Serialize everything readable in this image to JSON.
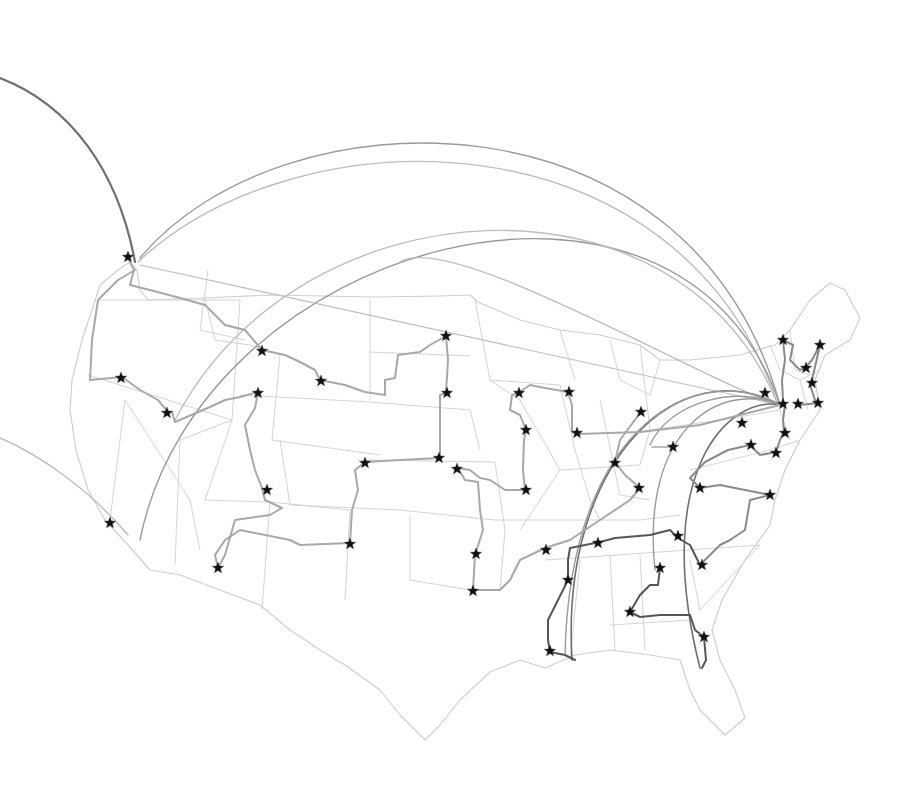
{
  "map": {
    "width": 898,
    "height": 802,
    "background": "#ffffff",
    "colors": {
      "state_border": "#d4d4d4",
      "route_light": "#a8a8a8",
      "route_mid": "#8a8a8a",
      "route_dark": "#555555",
      "arc_light": "#bdbdbd",
      "arc_mid": "#9a9a9a",
      "arc_dark": "#6f6f6f",
      "star": "#111111"
    },
    "outline": "M130,262 L137,270 L140,290 L148,300 L205,298 L270,295 L375,297 L440,296 L470,295 L478,302 L520,320 L560,330 L600,335 L640,345 L660,360 L690,360 L740,355 L775,345 L790,330 L810,300 L830,283 L845,290 L860,318 L850,340 L825,355 L815,380 L820,410 L800,440 L785,470 L775,500 L770,525 L745,560 L722,600 L712,630 L720,660 L735,690 L745,718 L725,735 L700,710 L690,690 L680,660 L650,655 L610,650 L575,655 L545,668 L520,660 L490,672 L460,700 L440,725 L425,740 L400,715 L380,690 L345,665 L320,650 L290,630 L260,605 L220,590 L180,575 L150,570 L128,545 L105,520 L88,490 L76,450 L70,410 L72,380 L82,340 L92,310 L100,285 L118,270 Z",
    "state_lines": [
      "M100,300 L240,300 M240,300 L232,420",
      "M88,375 L232,420",
      "M125,400 L110,520 M125,400 L190,500 L200,550",
      "M232,420 L180,440 L175,565",
      "M208,270 L200,330 L245,340",
      "M205,298 L215,340 L250,345 L280,355",
      "M280,355 L272,440 M272,440 L380,455",
      "M240,395 L370,402",
      "M232,420 L205,500 L270,502",
      "M270,502 L262,610",
      "M270,502 L350,510 L345,600",
      "M280,440 L290,505 L400,510",
      "M370,300 L370,400 M370,352 L470,356",
      "M370,402 L470,410 L480,450",
      "M365,460 L495,462",
      "M400,510 L495,520",
      "M410,515 L410,580 L470,590 L500,590",
      "M495,462 L505,530 L500,590",
      "M475,300 L490,380 L520,400",
      "M490,380 L560,385 M520,400 L560,470 L520,530",
      "M560,385 L575,450 L590,500 L600,520",
      "M600,400 L620,495 L650,500",
      "M495,520 L640,520 L680,515",
      "M545,560 L760,545",
      "M560,470 L640,465 L650,430 L720,420",
      "M640,345 L650,430",
      "M580,560 L570,660 M640,555 L645,650",
      "M610,555 L615,650 M610,625 L690,620",
      "M690,560 L700,610 L760,545",
      "M720,420 L780,410 L790,440",
      "M690,470 L770,450 L800,440",
      "M770,345 L780,370 L800,380 L820,370",
      "M790,330 L795,370 L810,375",
      "M800,380 L808,410",
      "M560,330 L575,380 M610,340 L620,380",
      "M620,380 L650,395 L660,360"
    ],
    "routes": [
      {
        "tone": "light",
        "width": 2,
        "points": "128,258 134,270 130,285 150,290 180,298 205,305 225,325 245,330 262,350"
      },
      {
        "tone": "light",
        "width": 2,
        "points": "262,350 285,355 300,362 315,370 320,380"
      },
      {
        "tone": "light",
        "width": 2,
        "points": "320,380 345,385 365,392 385,395 385,380 395,378 398,355 420,352 430,345 446,336"
      },
      {
        "tone": "light",
        "width": 2,
        "points": "446,336 448,360 446,393"
      },
      {
        "tone": "light",
        "width": 2,
        "points": "446,393 440,395 440,458"
      },
      {
        "tone": "light",
        "width": 2,
        "points": "440,458 400,460 365,462"
      },
      {
        "tone": "light",
        "width": 2,
        "points": "365,462 355,470 358,490 352,510 350,543"
      },
      {
        "tone": "light",
        "width": 2,
        "points": "350,543 300,545 290,540 240,530 225,540 215,555 218,568"
      },
      {
        "tone": "light",
        "width": 2,
        "points": "218,568 225,555 235,520 270,515 282,508 265,500 262,488"
      },
      {
        "tone": "light",
        "width": 2,
        "points": "262,488 255,470 250,450 245,425 255,408 258,392"
      },
      {
        "tone": "light",
        "width": 2,
        "points": "258,392 240,397 225,400 210,407 175,422 172,412"
      },
      {
        "tone": "light",
        "width": 2,
        "points": "168,412 158,400 140,390 122,377 90,380"
      },
      {
        "tone": "light",
        "width": 2,
        "points": "90,380 92,340 98,300 118,280 135,270"
      },
      {
        "tone": "light",
        "width": 2,
        "points": "458,468 470,470 480,478 490,480 505,490 525,490"
      },
      {
        "tone": "light",
        "width": 2,
        "points": "458,468 465,480 478,482 480,510 483,530 475,555"
      },
      {
        "tone": "light",
        "width": 2,
        "points": "475,555 473,590"
      },
      {
        "tone": "light",
        "width": 2,
        "points": "473,590 500,590 510,580 520,560 545,548"
      },
      {
        "tone": "light",
        "width": 2,
        "points": "525,490 523,470 524,440 526,430"
      },
      {
        "tone": "light",
        "width": 2,
        "points": "526,430 520,415 510,410 512,395 518,393"
      },
      {
        "tone": "light",
        "width": 2,
        "points": "518,393 530,385 545,388 568,392"
      },
      {
        "tone": "light",
        "width": 2,
        "points": "568,392 572,405 572,432 578,434"
      },
      {
        "tone": "light",
        "width": 2,
        "points": "578,434 640,432 700,425 760,410 780,405"
      },
      {
        "tone": "light",
        "width": 2,
        "points": "545,548 570,540 600,520 630,500 640,488"
      },
      {
        "tone": "light",
        "width": 2,
        "points": "640,488 625,475 615,462 620,440 640,413"
      },
      {
        "tone": "light",
        "width": 1.6,
        "points": "652,447 674,447"
      },
      {
        "tone": "mid",
        "width": 2,
        "points": "700,488 720,485 745,490 770,495"
      },
      {
        "tone": "mid",
        "width": 2,
        "points": "770,495 750,500 745,530 730,540 720,545 700,565"
      },
      {
        "tone": "mid",
        "width": 2,
        "points": "700,488 690,478 705,462 728,450 750,445"
      },
      {
        "tone": "mid",
        "width": 2,
        "points": "750,445 760,455 776,452"
      },
      {
        "tone": "mid",
        "width": 2,
        "points": "776,452 780,440 784,432 783,420 785,405"
      },
      {
        "tone": "mid",
        "width": 2,
        "points": "783,340 793,345 790,360 800,370 805,368"
      },
      {
        "tone": "mid",
        "width": 2,
        "points": "805,368 812,360 820,345 812,380 810,385"
      },
      {
        "tone": "mid",
        "width": 2,
        "points": "810,385 815,400 818,403 800,405"
      },
      {
        "tone": "mid",
        "width": 2,
        "points": "783,340 785,360 782,380 783,400"
      },
      {
        "tone": "dark",
        "width": 2,
        "points": "550,652 548,640 548,620 558,600 568,580 568,560 570,548 600,542 615,538 650,535 670,530 678,538"
      },
      {
        "tone": "dark",
        "width": 2,
        "points": "678,538 690,545 700,565"
      },
      {
        "tone": "dark",
        "width": 2,
        "points": "550,652 565,655 575,660"
      },
      {
        "tone": "dark",
        "width": 2,
        "points": "660,568 658,585 650,585 640,595 630,612"
      },
      {
        "tone": "dark",
        "width": 2,
        "points": "630,612 640,617 660,615 690,615 695,630 704,637 706,660 702,668"
      }
    ],
    "arcs": [
      {
        "tone": "dark",
        "width": 2.2,
        "d": "M0,78 C70,105 118,170 135,262"
      },
      {
        "tone": "mid",
        "width": 1.4,
        "d": "M140,258 C280,90 690,80 780,405"
      },
      {
        "tone": "light",
        "width": 1.4,
        "d": "M138,262 C300,110 680,110 778,405"
      },
      {
        "tone": "mid",
        "width": 1.4,
        "d": "M140,540 C200,240 680,110 780,405"
      },
      {
        "tone": "light",
        "width": 1.4,
        "d": "M175,420 C300,180 680,160 778,405"
      },
      {
        "tone": "light",
        "width": 1.4,
        "d": "M0,438 C40,455 90,490 128,535"
      },
      {
        "tone": "light",
        "width": 1.4,
        "d": "M400,262 C450,230 700,380 780,405"
      },
      {
        "tone": "light",
        "width": 1.2,
        "d": "M140,265 L780,405"
      },
      {
        "tone": "dark",
        "width": 1.6,
        "d": "M572,660 C560,460 680,350 780,405"
      },
      {
        "tone": "mid",
        "width": 1.4,
        "d": "M565,655 C570,420 700,360 780,405"
      },
      {
        "tone": "mid",
        "width": 1.4,
        "d": "M655,570 C640,430 720,380 780,405"
      },
      {
        "tone": "dark",
        "width": 1.6,
        "d": "M700,668 C650,470 730,395 780,405"
      },
      {
        "tone": "mid",
        "width": 1.4,
        "d": "M650,445 C670,400 740,385 780,405"
      }
    ],
    "cities": [
      {
        "x": 128,
        "y": 257
      },
      {
        "x": 262,
        "y": 351
      },
      {
        "x": 321,
        "y": 381
      },
      {
        "x": 446,
        "y": 336
      },
      {
        "x": 447,
        "y": 393
      },
      {
        "x": 121,
        "y": 378
      },
      {
        "x": 167,
        "y": 413
      },
      {
        "x": 258,
        "y": 393
      },
      {
        "x": 267,
        "y": 490
      },
      {
        "x": 110,
        "y": 523
      },
      {
        "x": 218,
        "y": 568
      },
      {
        "x": 350,
        "y": 544
      },
      {
        "x": 365,
        "y": 463
      },
      {
        "x": 439,
        "y": 458
      },
      {
        "x": 457,
        "y": 469
      },
      {
        "x": 476,
        "y": 554
      },
      {
        "x": 473,
        "y": 591
      },
      {
        "x": 546,
        "y": 550
      },
      {
        "x": 519,
        "y": 393
      },
      {
        "x": 569,
        "y": 392
      },
      {
        "x": 577,
        "y": 433
      },
      {
        "x": 526,
        "y": 430
      },
      {
        "x": 526,
        "y": 490
      },
      {
        "x": 615,
        "y": 463
      },
      {
        "x": 639,
        "y": 488
      },
      {
        "x": 641,
        "y": 412
      },
      {
        "x": 673,
        "y": 447
      },
      {
        "x": 598,
        "y": 543
      },
      {
        "x": 568,
        "y": 580
      },
      {
        "x": 550,
        "y": 651
      },
      {
        "x": 660,
        "y": 568
      },
      {
        "x": 630,
        "y": 612
      },
      {
        "x": 704,
        "y": 637
      },
      {
        "x": 678,
        "y": 536
      },
      {
        "x": 702,
        "y": 565
      },
      {
        "x": 700,
        "y": 488
      },
      {
        "x": 770,
        "y": 495
      },
      {
        "x": 751,
        "y": 445
      },
      {
        "x": 776,
        "y": 453
      },
      {
        "x": 785,
        "y": 433
      },
      {
        "x": 742,
        "y": 423
      },
      {
        "x": 765,
        "y": 393
      },
      {
        "x": 798,
        "y": 404
      },
      {
        "x": 818,
        "y": 403
      },
      {
        "x": 812,
        "y": 383
      },
      {
        "x": 806,
        "y": 368
      },
      {
        "x": 820,
        "y": 345
      },
      {
        "x": 783,
        "y": 340
      },
      {
        "x": 783,
        "y": 404
      }
    ]
  }
}
